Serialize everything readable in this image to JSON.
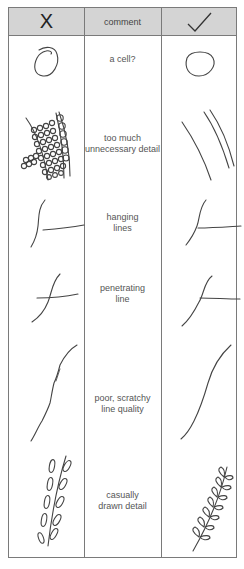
{
  "header": {
    "bad_label": "X",
    "comment_label": "comment",
    "good_label": "✓"
  },
  "columns": [
    "X (incorrect)",
    "comment",
    "✓ (correct)"
  ],
  "rows": [
    {
      "comment": "a cell?",
      "bad_icon": "scribbled-circle",
      "good_icon": "clean-circle"
    },
    {
      "comment": "too much\nunnecessary detail",
      "bad_icon": "detailed-cell-wall",
      "good_icon": "simple-parallel-lines"
    },
    {
      "comment": "hanging\nlines",
      "bad_icon": "hanging-line-junction",
      "good_icon": "connected-line-junction"
    },
    {
      "comment": "penetrating\nline",
      "bad_icon": "penetrating-line-junction",
      "good_icon": "touching-line-junction"
    },
    {
      "comment": "poor, scratchy\nline quality",
      "bad_icon": "scratchy-curve",
      "good_icon": "smooth-curve"
    },
    {
      "comment": "casually\ndrawn detail",
      "bad_icon": "casual-leaf-sprig",
      "good_icon": "careful-leaf-sprig"
    }
  ],
  "colors": {
    "header_bg": "#d4d4d4",
    "border": "#7a7a7a",
    "ink": "#444444"
  }
}
